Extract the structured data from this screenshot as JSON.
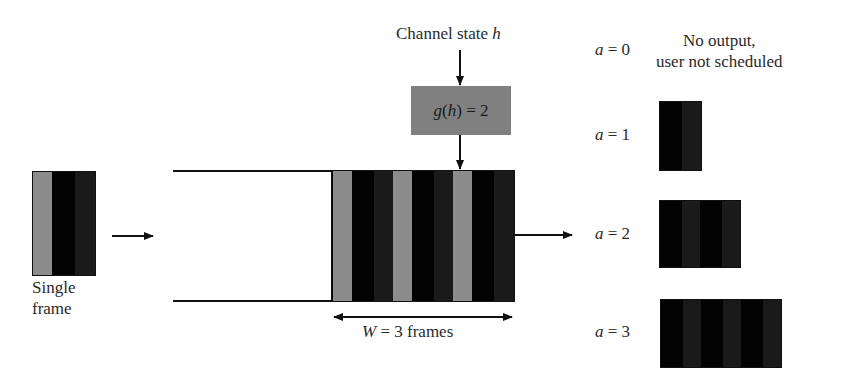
{
  "diagram": {
    "channel_label": {
      "prefix": "Channel state ",
      "var": "h"
    },
    "gain_box": {
      "label_func": "g",
      "label_arg": "h",
      "label_rest": " = 2",
      "color": "#808080"
    },
    "single_frame_label": {
      "line1": "Single",
      "line2": "frame"
    },
    "window_label": {
      "var": "W",
      "rest": " = 3 frames"
    },
    "outputs": [
      {
        "var": "a",
        "value": " = 0",
        "desc_line1": "No output,",
        "desc_line2": "user not scheduled",
        "frames": 0
      },
      {
        "var": "a",
        "value": " = 1",
        "frames": 1
      },
      {
        "var": "a",
        "value": " = 2",
        "frames": 2
      },
      {
        "var": "a",
        "value": " = 3",
        "frames": 3
      }
    ],
    "colors": {
      "stripe_gray": "#8c8c8c",
      "stripe_black": "#030303",
      "stripe_dark": "#1a1a1a",
      "line": "#111111"
    }
  }
}
